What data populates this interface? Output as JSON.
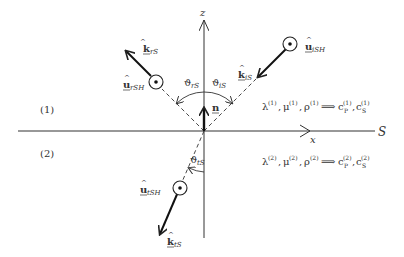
{
  "figure": {
    "type": "interface-wave-diagram",
    "axes": {
      "z_label": "z",
      "x_label": "x",
      "interface_label": "S"
    },
    "normal_vector": {
      "symbol": "n",
      "hat": false,
      "underline": true
    },
    "media": [
      {
        "label": "(1)",
        "relation": "λ(1), μ(1), ρ(1) ⟹ cP(1), cS(1)",
        "lhs": [
          "λ",
          "μ",
          "ρ"
        ],
        "superscript": "(1)",
        "rhs": [
          "c",
          "c"
        ],
        "rhs_subs": [
          "P",
          "S"
        ]
      },
      {
        "label": "(2)",
        "relation": "λ(2), μ(2), ρ(2) ⟹ cP(2), cS(2)",
        "lhs": [
          "λ",
          "μ",
          "ρ"
        ],
        "superscript": "(2)",
        "rhs": [
          "c",
          "c"
        ],
        "rhs_subs": [
          "P",
          "S"
        ]
      }
    ],
    "waves": [
      {
        "name": "incident",
        "k_label": "k",
        "k_sub": "iS",
        "u_label": "u",
        "u_sub": "iSH",
        "angle_label": "ϑ",
        "angle_sub": "iS"
      },
      {
        "name": "reflected",
        "k_label": "k",
        "k_sub": "rS",
        "u_label": "u",
        "u_sub": "rSH",
        "angle_label": "ϑ",
        "angle_sub": "rS"
      },
      {
        "name": "transmitted",
        "k_label": "k",
        "k_sub": "tS",
        "u_label": "u",
        "u_sub": "tSH",
        "angle_label": "ϑ",
        "angle_sub": "tS"
      }
    ],
    "colors": {
      "line": "#222222",
      "text": "#333333",
      "background": "#ffffff"
    }
  }
}
